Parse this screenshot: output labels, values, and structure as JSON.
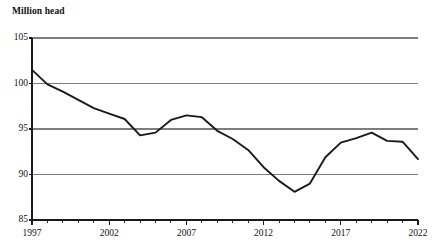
{
  "chart_data": {
    "type": "line",
    "title": "",
    "subtitle": "",
    "xlabel": "",
    "ylabel": "Million head",
    "ylabel_position": "above-axis-top-left",
    "grid": true,
    "gridlines_y": [
      90,
      95,
      100,
      105
    ],
    "legend": null,
    "legend_position": "none",
    "xlim": [
      1997,
      2022
    ],
    "ylim": [
      85,
      105
    ],
    "y_ticks": [
      85,
      90,
      95,
      100,
      105
    ],
    "y_tick_labels": [
      "85",
      "90",
      "95",
      "100",
      "105"
    ],
    "x_ticks": [
      1997,
      2002,
      2007,
      2012,
      2017,
      2022
    ],
    "x_tick_labels": [
      "1997",
      "2002",
      "2007",
      "2012",
      "2017",
      "2022"
    ],
    "x_minor_tick_interval": 1,
    "series": [
      {
        "name": "Million head",
        "color": "#1a1a1a",
        "x": [
          1997,
          1998,
          1999,
          2000,
          2001,
          2002,
          2003,
          2004,
          2005,
          2006,
          2007,
          2008,
          2009,
          2010,
          2011,
          2012,
          2013,
          2014,
          2015,
          2016,
          2017,
          2018,
          2019,
          2020,
          2021,
          2022
        ],
        "values": [
          101.5,
          99.9,
          99.1,
          98.2,
          97.3,
          96.7,
          96.1,
          94.3,
          94.6,
          96.0,
          96.5,
          96.3,
          94.8,
          93.9,
          92.7,
          90.8,
          89.3,
          88.1,
          89.0,
          91.9,
          93.5,
          94.0,
          94.6,
          93.7,
          93.6,
          91.7
        ]
      }
    ]
  },
  "axis": {
    "y_title": "Million head"
  }
}
